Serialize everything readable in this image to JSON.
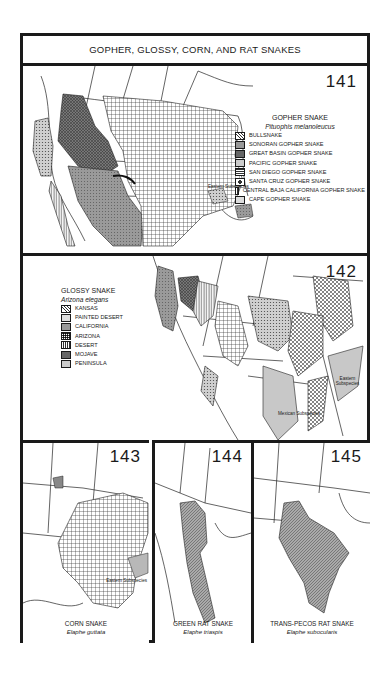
{
  "page": {
    "title": "GOPHER, GLOSSY, CORN, AND RAT SNAKES"
  },
  "maps": [
    {
      "number": "141",
      "common_name": "GOPHER SNAKE",
      "scientific_name": "Pituophis melanoleucus",
      "legend": [
        {
          "label": "BULLSNAKE",
          "pattern": "diamond-crosshatch-light"
        },
        {
          "label": "SONORAN GOPHER SNAKE",
          "pattern": "dense-gray"
        },
        {
          "label": "GREAT BASIN GOPHER SNAKE",
          "pattern": "dark-crosshatch"
        },
        {
          "label": "PACIFIC GOPHER SNAKE",
          "pattern": "dotted"
        },
        {
          "label": "SAN DIEGO GOPHER SNAKE",
          "pattern": "horizontal-lines"
        },
        {
          "label": "SANTA CRUZ GOPHER SNAKE",
          "pattern": "island-dot"
        },
        {
          "label": "CENTRAL BAJA CALIFORNIA GOPHER SNAKE",
          "pattern": "vertical-lines"
        },
        {
          "label": "CAPE GOPHER SNAKE",
          "pattern": "fine-dots"
        }
      ],
      "annotations": [
        "Eastern Subspecies",
        "?"
      ]
    },
    {
      "number": "142",
      "common_name": "GLOSSY SNAKE",
      "scientific_name": "Arizona elegans",
      "legend": [
        {
          "label": "KANSAS",
          "pattern": "diamond-crosshatch"
        },
        {
          "label": "PAINTED DESERT",
          "pattern": "light-dots"
        },
        {
          "label": "CALIFORNIA",
          "pattern": "medium-gray"
        },
        {
          "label": "ARIZONA",
          "pattern": "grid"
        },
        {
          "label": "DESERT",
          "pattern": "vertical-lines"
        },
        {
          "label": "MOJAVE",
          "pattern": "dark-crosshatch"
        },
        {
          "label": "PENINSULA",
          "pattern": "fine-dots"
        }
      ],
      "annotations": [
        "Eastern Subspecies",
        "Mexican Subspecies",
        "?"
      ]
    },
    {
      "number": "143",
      "common_name": "CORN SNAKE",
      "scientific_name": "Elaphe guttata",
      "annotations": [
        "Eastern Subspecies"
      ]
    },
    {
      "number": "144",
      "common_name": "GREEN RAT SNAKE",
      "scientific_name": "Elaphe triaspis"
    },
    {
      "number": "145",
      "common_name": "TRANS-PECOS RAT SNAKE",
      "scientific_name": "Elaphe subocularis"
    }
  ],
  "colors": {
    "ink": "#1a1a1a",
    "paper": "#ffffff",
    "range_dark": "#6e6e6e",
    "range_medium": "#9a9a9a",
    "range_light": "#c8c8c8"
  }
}
